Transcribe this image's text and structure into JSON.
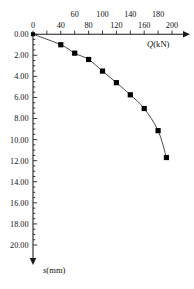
{
  "chart_data": {
    "type": "line",
    "title": "",
    "subtitle": "",
    "xlabel": "Q(kN)",
    "xlabel_variable": "Q",
    "xlabel_unit": "(kN)",
    "ylabel": "s(mm)",
    "ylabel_variable": "s",
    "ylabel_unit": "(mm)",
    "x_axis_position": "top",
    "y_axis_direction": "down",
    "xlim": [
      0,
      200
    ],
    "ylim": [
      0,
      20
    ],
    "grid": false,
    "legend": null,
    "x_tick_interval": 20,
    "y_tick_interval": 2,
    "x_ticks": [
      0,
      20,
      40,
      60,
      80,
      100,
      120,
      140,
      160,
      180,
      200
    ],
    "x_tick_labels": [
      "0",
      "",
      "40",
      "60",
      "80",
      "100",
      "120",
      "140",
      "160",
      "180",
      "200"
    ],
    "x_tick_label_rows": {
      "upper": [
        "60",
        "100",
        "140",
        "180"
      ],
      "lower": [
        "0",
        "40",
        "80",
        "120",
        "160",
        "200"
      ]
    },
    "y_ticks": [
      0,
      2,
      4,
      6,
      8,
      10,
      12,
      14,
      16,
      18,
      20
    ],
    "y_tick_labels": [
      "0.00",
      "2.00",
      "4.00",
      "6.00",
      "8.00",
      "10.00",
      "12.00",
      "14.00",
      "16.00",
      "18.00",
      "20.00"
    ],
    "y_minor_tick_interval": 0.5,
    "series": [
      {
        "name": "load-settlement",
        "marker": "filled-square",
        "x": [
          0,
          40,
          60,
          80,
          100,
          120,
          140,
          160,
          180,
          192
        ],
        "values": [
          0.0,
          1.0,
          1.8,
          2.4,
          3.5,
          4.6,
          5.75,
          7.05,
          9.15,
          11.7
        ]
      }
    ]
  },
  "colors": {
    "axis": "#1a1a1a",
    "curve": "#4a4a4a",
    "marker": "#000000",
    "background": "#ffffff"
  }
}
